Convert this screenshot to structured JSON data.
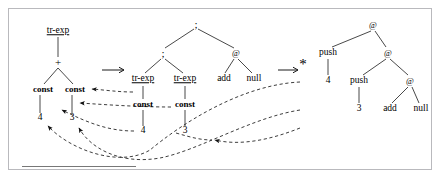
{
  "figure": {
    "separator_label": "footnote-rule"
  },
  "symbols": {
    "rewrite_arrow": "⟶",
    "star": "*",
    "at": "@",
    "semicolon": ";",
    "plus": "+"
  },
  "trees": {
    "source": {
      "name": "source-tree",
      "nodes": [
        {
          "id": "s-root",
          "label": "tr-exp",
          "style": "underline",
          "x": 58,
          "y": 31
        },
        {
          "id": "s-plus",
          "label": "+",
          "style": "symbol",
          "x": 58,
          "y": 62
        },
        {
          "id": "s-const-left",
          "label": "const",
          "style": "bold",
          "x": 43,
          "y": 89
        },
        {
          "id": "s-const-right",
          "label": "const",
          "style": "bold",
          "x": 75,
          "y": 89
        },
        {
          "id": "s-num-4",
          "label": "4",
          "style": "number",
          "x": 40,
          "y": 118
        },
        {
          "id": "s-num-3",
          "label": "3",
          "style": "number",
          "x": 72,
          "y": 118
        }
      ]
    },
    "middle": {
      "name": "intermediate-tree",
      "nodes": [
        {
          "id": "m-root",
          "label": ";",
          "style": "symbol",
          "x": 196,
          "y": 24
        },
        {
          "id": "m-semi",
          "label": ";",
          "style": "symbol",
          "x": 163,
          "y": 53
        },
        {
          "id": "m-at",
          "label": "@",
          "style": "at",
          "x": 236,
          "y": 53
        },
        {
          "id": "m-trexp-1",
          "label": "tr-exp",
          "style": "underline",
          "x": 143,
          "y": 79
        },
        {
          "id": "m-trexp-2",
          "label": "tr-exp",
          "style": "underline",
          "x": 185,
          "y": 79
        },
        {
          "id": "m-add",
          "label": "add",
          "style": "plain",
          "x": 224,
          "y": 79
        },
        {
          "id": "m-null",
          "label": "null",
          "style": "plain",
          "x": 254,
          "y": 79
        },
        {
          "id": "m-const-1",
          "label": "const",
          "style": "bold",
          "x": 143,
          "y": 104
        },
        {
          "id": "m-const-2",
          "label": "const",
          "style": "bold",
          "x": 185,
          "y": 104
        },
        {
          "id": "m-num-4",
          "label": "4",
          "style": "number",
          "x": 143,
          "y": 131
        },
        {
          "id": "m-num-3",
          "label": "3",
          "style": "number",
          "x": 185,
          "y": 131
        }
      ]
    },
    "target": {
      "name": "bytecode-tree",
      "nodes": [
        {
          "id": "t-at-1",
          "label": "@",
          "style": "at",
          "x": 373,
          "y": 25
        },
        {
          "id": "t-push-1",
          "label": "push",
          "style": "plain",
          "x": 328,
          "y": 53
        },
        {
          "id": "t-at-2",
          "label": "@",
          "style": "at",
          "x": 388,
          "y": 53
        },
        {
          "id": "t-num-4",
          "label": "4",
          "style": "number",
          "x": 328,
          "y": 81
        },
        {
          "id": "t-push-2",
          "label": "push",
          "style": "plain",
          "x": 359,
          "y": 81
        },
        {
          "id": "t-at-3",
          "label": "@",
          "style": "at",
          "x": 410,
          "y": 81
        },
        {
          "id": "t-num-3",
          "label": "3",
          "style": "number",
          "x": 359,
          "y": 109
        },
        {
          "id": "t-add",
          "label": "add",
          "style": "plain",
          "x": 390,
          "y": 109
        },
        {
          "id": "t-null",
          "label": "null",
          "style": "plain",
          "x": 421,
          "y": 109
        }
      ]
    }
  },
  "arrows": {
    "first_rewrite": {
      "label": "⟶",
      "x": 113,
      "y": 70
    },
    "second_rewrite": {
      "label": "⟶",
      "x": 289,
      "y": 70
    },
    "star": {
      "label": "*",
      "x": 303,
      "y": 64
    }
  }
}
